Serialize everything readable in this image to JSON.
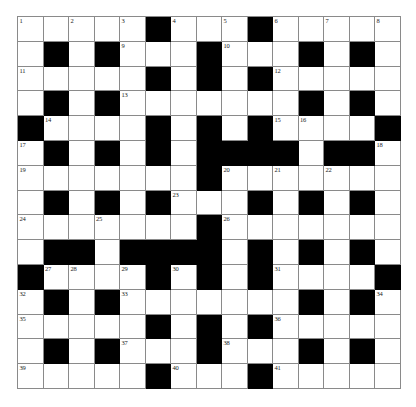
{
  "puzzle": {
    "type": "crossword-grid",
    "title": "",
    "rows": 15,
    "cols": 15,
    "cell_size_px": 25.5,
    "colors": {
      "background": "#ffffff",
      "block": "#000000",
      "gridline": "#8a8a8a",
      "number_text": "#1a1a1a"
    },
    "legend": {
      "empty_cell": "white square (answer entry)",
      "blocked_cell": "black square (no entry)"
    },
    "max_clue_number": 41,
    "blocks": [
      [
        0,
        0,
        0,
        0,
        0,
        1,
        0,
        0,
        0,
        1,
        0,
        0,
        0,
        0,
        0
      ],
      [
        0,
        1,
        0,
        1,
        0,
        0,
        0,
        1,
        0,
        0,
        0,
        1,
        0,
        1,
        0
      ],
      [
        0,
        0,
        0,
        0,
        0,
        1,
        0,
        1,
        0,
        1,
        0,
        0,
        0,
        0,
        0
      ],
      [
        0,
        1,
        0,
        1,
        0,
        0,
        0,
        0,
        0,
        0,
        0,
        1,
        0,
        1,
        0
      ],
      [
        1,
        0,
        0,
        0,
        0,
        1,
        0,
        1,
        0,
        1,
        0,
        0,
        0,
        0,
        1
      ],
      [
        0,
        1,
        0,
        1,
        0,
        1,
        0,
        1,
        1,
        1,
        1,
        0,
        1,
        1,
        0
      ],
      [
        0,
        0,
        0,
        0,
        0,
        0,
        0,
        1,
        0,
        0,
        0,
        0,
        0,
        0,
        0
      ],
      [
        0,
        1,
        0,
        1,
        0,
        1,
        0,
        0,
        0,
        1,
        0,
        1,
        0,
        1,
        0
      ],
      [
        0,
        0,
        0,
        0,
        0,
        0,
        0,
        1,
        0,
        0,
        0,
        0,
        0,
        0,
        0
      ],
      [
        0,
        1,
        1,
        0,
        1,
        1,
        1,
        1,
        0,
        1,
        0,
        1,
        0,
        1,
        0
      ],
      [
        1,
        0,
        0,
        0,
        0,
        1,
        0,
        1,
        0,
        1,
        0,
        0,
        0,
        0,
        1
      ],
      [
        0,
        1,
        0,
        1,
        0,
        0,
        0,
        0,
        0,
        0,
        0,
        1,
        0,
        1,
        0
      ],
      [
        0,
        0,
        0,
        0,
        0,
        1,
        0,
        1,
        0,
        1,
        0,
        0,
        0,
        0,
        0
      ],
      [
        0,
        1,
        0,
        1,
        0,
        0,
        0,
        1,
        0,
        0,
        0,
        1,
        0,
        1,
        0
      ],
      [
        0,
        0,
        0,
        0,
        0,
        1,
        0,
        0,
        0,
        1,
        0,
        0,
        0,
        0,
        0
      ]
    ],
    "numbers": [
      {
        "row": 0,
        "col": 0,
        "n": "1"
      },
      {
        "row": 0,
        "col": 2,
        "n": "2"
      },
      {
        "row": 0,
        "col": 4,
        "n": "3"
      },
      {
        "row": 0,
        "col": 6,
        "n": "4"
      },
      {
        "row": 0,
        "col": 8,
        "n": "5"
      },
      {
        "row": 0,
        "col": 10,
        "n": "6"
      },
      {
        "row": 0,
        "col": 12,
        "n": "7"
      },
      {
        "row": 0,
        "col": 14,
        "n": "8"
      },
      {
        "row": 1,
        "col": 4,
        "n": "9"
      },
      {
        "row": 1,
        "col": 8,
        "n": "10"
      },
      {
        "row": 2,
        "col": 0,
        "n": "11"
      },
      {
        "row": 2,
        "col": 10,
        "n": "12"
      },
      {
        "row": 3,
        "col": 4,
        "n": "13"
      },
      {
        "row": 4,
        "col": 1,
        "n": "14"
      },
      {
        "row": 4,
        "col": 10,
        "n": "15"
      },
      {
        "row": 4,
        "col": 11,
        "n": "16"
      },
      {
        "row": 5,
        "col": 0,
        "n": "17"
      },
      {
        "row": 5,
        "col": 14,
        "n": "18"
      },
      {
        "row": 6,
        "col": 0,
        "n": "19"
      },
      {
        "row": 6,
        "col": 8,
        "n": "20"
      },
      {
        "row": 6,
        "col": 10,
        "n": "21"
      },
      {
        "row": 6,
        "col": 12,
        "n": "22"
      },
      {
        "row": 7,
        "col": 6,
        "n": "23"
      },
      {
        "row": 8,
        "col": 0,
        "n": "24"
      },
      {
        "row": 8,
        "col": 3,
        "n": "25"
      },
      {
        "row": 8,
        "col": 8,
        "n": "26"
      },
      {
        "row": 10,
        "col": 1,
        "n": "27"
      },
      {
        "row": 10,
        "col": 2,
        "n": "28"
      },
      {
        "row": 10,
        "col": 4,
        "n": "29"
      },
      {
        "row": 10,
        "col": 6,
        "n": "30"
      },
      {
        "row": 10,
        "col": 10,
        "n": "31"
      },
      {
        "row": 11,
        "col": 0,
        "n": "32"
      },
      {
        "row": 11,
        "col": 4,
        "n": "33"
      },
      {
        "row": 11,
        "col": 14,
        "n": "34"
      },
      {
        "row": 12,
        "col": 0,
        "n": "35"
      },
      {
        "row": 12,
        "col": 10,
        "n": "36"
      },
      {
        "row": 13,
        "col": 4,
        "n": "37"
      },
      {
        "row": 13,
        "col": 8,
        "n": "38"
      },
      {
        "row": 14,
        "col": 0,
        "n": "39"
      },
      {
        "row": 14,
        "col": 6,
        "n": "40"
      },
      {
        "row": 14,
        "col": 10,
        "n": "41"
      }
    ]
  }
}
